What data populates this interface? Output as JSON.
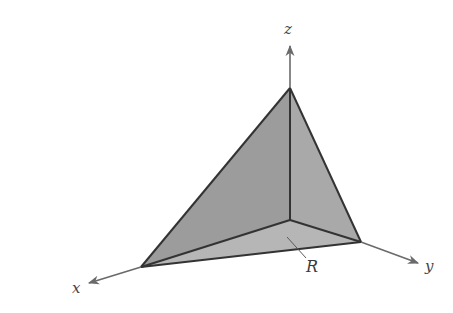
{
  "figure": {
    "type": "3d-tetrahedron-solid",
    "labels": {
      "x_axis": "x",
      "y_axis": "y",
      "z_axis": "z",
      "region": "R"
    },
    "colors": {
      "background": "#ffffff",
      "face_front": "#9a9a9a",
      "face_side": "#a8a8a8",
      "face_base": "#b4b4b4",
      "edge": "#333333",
      "axis": "#6a6a6a",
      "label": "#444444"
    },
    "vertices_px": {
      "apex_z": [
        290,
        88
      ],
      "origin": [
        290,
        220
      ],
      "x_intercept": [
        141,
        267
      ],
      "y_intercept": [
        361,
        242
      ]
    }
  }
}
